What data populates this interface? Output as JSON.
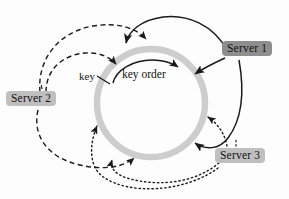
{
  "figure": {
    "type": "consistent-hashing-ring-diagram",
    "background_color": "#fdfdfd"
  },
  "ring": {
    "name": "key-space-ring",
    "color": "#c9c9c9",
    "center_x": 151,
    "center_y": 103,
    "radius": 54,
    "stroke_width": 6
  },
  "labels": {
    "key": "key",
    "key_order": "key order"
  },
  "nodes": [
    {
      "id": "server-1",
      "label": "Server 1",
      "background": "#8e8e8e",
      "text_color": "#111111",
      "edge_style": "solid",
      "x": 222,
      "y": 41
    },
    {
      "id": "server-2",
      "label": "Server 2",
      "background": "#bfbfbf",
      "text_color": "#111111",
      "edge_style": "dashed",
      "x": 6,
      "y": 91
    },
    {
      "id": "server-3",
      "label": "Server 3",
      "background": "#bfbfbf",
      "text_color": "#111111",
      "edge_style": "dotted",
      "x": 215,
      "y": 148
    }
  ],
  "edges": {
    "solid_color": "#1a1a1a",
    "dashed_color": "#1a1a1a",
    "dotted_color": "#1a1a1a",
    "solid_count": 3,
    "dashed_count": 3,
    "dotted_count": 3
  }
}
